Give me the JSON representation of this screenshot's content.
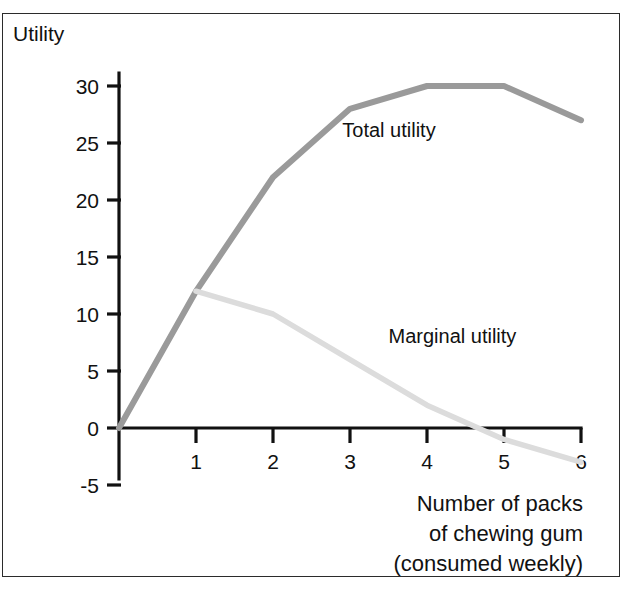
{
  "figure": {
    "background": "#ffffff",
    "border_color": "#2b2b2b"
  },
  "chart_data": {
    "type": "line",
    "title": "",
    "ylabel": "Utility",
    "xlabel": "Number of packs of chewing gum (consumed weekly)",
    "xlabel_lines": [
      "Number of packs",
      "of chewing gum",
      "(consumed weekly)"
    ],
    "x": [
      0,
      1,
      2,
      3,
      4,
      5,
      6
    ],
    "xticks": [
      1,
      2,
      3,
      4,
      5,
      6
    ],
    "xtick_labels": [
      "1",
      "2",
      "3",
      "4",
      "5",
      "6"
    ],
    "yticks": [
      30,
      25,
      20,
      15,
      10,
      5,
      0,
      -5
    ],
    "ytick_labels": [
      "30",
      "25",
      "20",
      "15",
      "10",
      "5",
      "0",
      "-5"
    ],
    "xlim": [
      0,
      6
    ],
    "ylim": [
      -5,
      33
    ],
    "grid": false,
    "legend": "inline-annotations",
    "series": [
      {
        "name": "Total utility",
        "color": "#9a9a9a",
        "x": [
          0,
          1,
          2,
          3,
          4,
          5,
          6
        ],
        "values": [
          0,
          12,
          22,
          28,
          30,
          30,
          27
        ],
        "label_text": "Total utility",
        "label_x": 2.9,
        "label_y": 25.5
      },
      {
        "name": "Marginal utility",
        "color": "#dcdcdc",
        "x": [
          1,
          2,
          3,
          4,
          5,
          6
        ],
        "values": [
          12,
          10,
          6,
          2,
          -1,
          -3
        ],
        "label_text": "Marginal utility",
        "label_x": 3.5,
        "label_y": 7.5
      }
    ]
  },
  "annotations": {
    "y_axis_title": "Utility",
    "total_utility_label": "Total utility",
    "marginal_utility_label": "Marginal utility"
  }
}
